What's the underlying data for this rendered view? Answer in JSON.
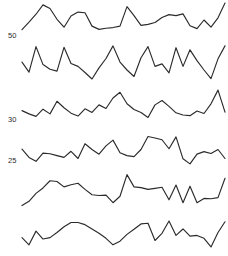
{
  "figure": {
    "title": "",
    "width": 228,
    "height": 256,
    "background": "#ffffff",
    "line_color": "#2b2b2b",
    "label_color": "#2b2b2b"
  },
  "axis_labels": [
    {
      "text": "50",
      "x": 8,
      "y": 38
    },
    {
      "text": "30",
      "x": 8,
      "y": 122
    },
    {
      "text": "25",
      "x": 8,
      "y": 163
    }
  ],
  "chart_data": {
    "type": "line",
    "title": "",
    "xlabel": "",
    "ylabel": "",
    "grid": false,
    "legend": "none",
    "panel_layout": "stacked small multiples",
    "panel_count": 6,
    "x": [
      0,
      1,
      2,
      3,
      4,
      5,
      6,
      7,
      8,
      9,
      10,
      11,
      12,
      13,
      14,
      15,
      16,
      17,
      18,
      19,
      20,
      21,
      22,
      23,
      24,
      25,
      26,
      27,
      28,
      29
    ],
    "series": [
      {
        "name": "series-1",
        "label": "50",
        "values": [
          23,
          44,
          66,
          92,
          82,
          52,
          30,
          61,
          72,
          70,
          33,
          24,
          27,
          29,
          33,
          87,
          62,
          35,
          38,
          43,
          57,
          65,
          62,
          67,
          34,
          26,
          50,
          30,
          56,
          97
        ]
      },
      {
        "name": "series-2",
        "label": "",
        "values": [
          52,
          24,
          95,
          45,
          32,
          27,
          93,
          48,
          40,
          23,
          5,
          36,
          62,
          97,
          52,
          30,
          12,
          64,
          95,
          40,
          47,
          22,
          92,
          40,
          86,
          56,
          30,
          6,
          61,
          97
        ]
      },
      {
        "name": "series-3",
        "label": "30",
        "values": [
          36,
          27,
          20,
          40,
          27,
          62,
          44,
          29,
          21,
          41,
          31,
          52,
          42,
          71,
          87,
          55,
          39,
          31,
          17,
          52,
          64,
          48,
          30,
          24,
          22,
          35,
          28,
          55,
          93,
          32
        ]
      },
      {
        "name": "series-4",
        "label": "25",
        "values": [
          48,
          25,
          14,
          37,
          35,
          30,
          25,
          42,
          22,
          63,
          47,
          34,
          57,
          73,
          38,
          30,
          27,
          47,
          83,
          79,
          74,
          49,
          82,
          21,
          7,
          34,
          41,
          36,
          47,
          22
        ]
      },
      {
        "name": "series-5",
        "label": "",
        "values": [
          10,
          22,
          44,
          59,
          79,
          77,
          62,
          68,
          72,
          55,
          40,
          38,
          39,
          18,
          36,
          96,
          62,
          60,
          55,
          58,
          61,
          26,
          67,
          18,
          64,
          18,
          30,
          29,
          32,
          86
        ]
      },
      {
        "name": "series-6",
        "label": "",
        "values": [
          40,
          20,
          58,
          36,
          40,
          54,
          70,
          82,
          82,
          76,
          64,
          52,
          38,
          20,
          30,
          49,
          63,
          78,
          80,
          32,
          52,
          86,
          46,
          64,
          44,
          46,
          38,
          14,
          54,
          84
        ]
      }
    ],
    "ylim": [
      0,
      100
    ]
  }
}
